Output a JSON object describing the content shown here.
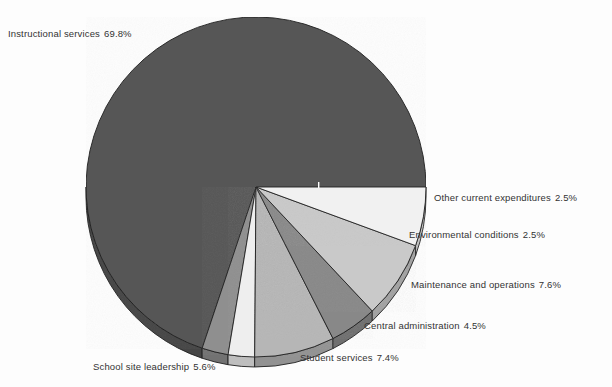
{
  "background_color": "#fdfdfd",
  "text_color": "#333333",
  "chart_data": {
    "type": "pie",
    "title": "",
    "subtitle": "",
    "xlabel": "",
    "ylabel": "",
    "legend_position": "outside-labels",
    "grid": false,
    "units": "percent",
    "total": 99.9,
    "center": {
      "x": 256,
      "y": 187
    },
    "radius": 170,
    "depth_3d": 10,
    "start_angle_deg": 0,
    "direction": "counterclockwise",
    "categories": [
      "Instructional services",
      "School site leadership",
      "Student services",
      "Central administration",
      "Maintenance and operations",
      "Environmental conditions",
      "Other current expenditures"
    ],
    "values": [
      69.8,
      5.6,
      7.4,
      4.5,
      7.6,
      2.5,
      2.5
    ],
    "slices": [
      {
        "label": "Instructional services",
        "value": 69.8,
        "percent_text": "69.8%",
        "color": "#565656",
        "edge_color": "#1f1f1f"
      },
      {
        "label": "Other current expenditures",
        "value": 2.5,
        "percent_text": "2.5%",
        "color": "#8f8f8f",
        "edge_color": "#1f1f1f"
      },
      {
        "label": "Environmental conditions",
        "value": 2.5,
        "percent_text": "2.5%",
        "color": "#eeeeee",
        "edge_color": "#1f1f1f"
      },
      {
        "label": "Maintenance and operations",
        "value": 7.6,
        "percent_text": "7.6%",
        "color": "#b6b6b6",
        "edge_color": "#1f1f1f"
      },
      {
        "label": "Central administration",
        "value": 4.5,
        "percent_text": "4.5%",
        "color": "#888888",
        "edge_color": "#1f1f1f"
      },
      {
        "label": "Student services",
        "value": 7.4,
        "percent_text": "7.4%",
        "color": "#c9c9c9",
        "edge_color": "#1f1f1f"
      },
      {
        "label": "School site leadership",
        "value": 5.6,
        "percent_text": "5.6%",
        "color": "#f1f1f1",
        "edge_color": "#1f1f1f"
      }
    ]
  },
  "labels": {
    "instructional": {
      "name": "Instructional services",
      "percent": "69.8%"
    },
    "other_current": {
      "name": "Other current expenditures",
      "percent": "2.5%"
    },
    "environmental": {
      "name": "Environmental conditions",
      "percent": "2.5%"
    },
    "maintenance": {
      "name": "Maintenance and operations",
      "percent": "7.6%"
    },
    "central": {
      "name": "Central administration",
      "percent": "4.5%"
    },
    "student": {
      "name": "Student services",
      "percent": "7.4%"
    },
    "school_site": {
      "name": "School site leadership",
      "percent": "5.6%"
    }
  }
}
